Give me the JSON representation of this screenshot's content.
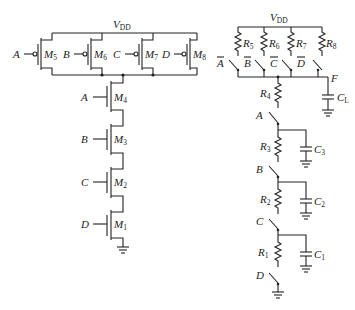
{
  "left_circuit": {
    "supply_label": "V",
    "supply_sub": "DD",
    "pmos": [
      {
        "name": "M",
        "sub": "5",
        "gate": "A"
      },
      {
        "name": "M",
        "sub": "6",
        "gate": "B"
      },
      {
        "name": "M",
        "sub": "7",
        "gate": "C"
      },
      {
        "name": "M",
        "sub": "8",
        "gate": "D"
      }
    ],
    "nmos": [
      {
        "name": "M",
        "sub": "4",
        "gate": "A"
      },
      {
        "name": "M",
        "sub": "3",
        "gate": "B"
      },
      {
        "name": "M",
        "sub": "2",
        "gate": "C"
      },
      {
        "name": "M",
        "sub": "1",
        "gate": "D"
      }
    ]
  },
  "right_circuit": {
    "supply_label": "V",
    "supply_sub": "DD",
    "pullup_resistors": [
      {
        "name": "R",
        "sub": "5",
        "switch": "A"
      },
      {
        "name": "R",
        "sub": "6",
        "switch": "B"
      },
      {
        "name": "R",
        "sub": "7",
        "switch": "C"
      },
      {
        "name": "R",
        "sub": "8",
        "switch": "D"
      }
    ],
    "output_label": "F",
    "load_cap": {
      "name": "C",
      "sub": "L"
    },
    "r4": {
      "name": "R",
      "sub": "4"
    },
    "stages": [
      {
        "switch": "A",
        "resistor": {
          "name": "R",
          "sub": "3"
        },
        "cap": {
          "name": "C",
          "sub": "3"
        }
      },
      {
        "switch": "B",
        "resistor": {
          "name": "R",
          "sub": "2"
        },
        "cap": {
          "name": "C",
          "sub": "2"
        }
      },
      {
        "switch": "C",
        "resistor": {
          "name": "R",
          "sub": "1"
        },
        "cap": {
          "name": "C",
          "sub": "1"
        }
      }
    ],
    "bottom_switch": "D"
  }
}
